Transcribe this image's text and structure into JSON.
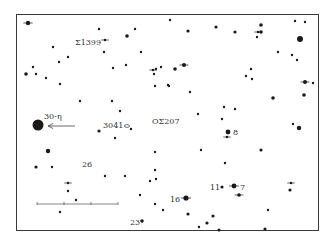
{
  "chart_data": {
    "type": "scatter",
    "title": "",
    "frame": {
      "x": 16,
      "y": 14,
      "w": 303,
      "h": 217
    },
    "ink_color": "#1a1a1a",
    "labels": [
      {
        "text": "Σ1399",
        "x": 75,
        "y": 43
      },
      {
        "text": "30-η",
        "x": 44,
        "y": 117
      },
      {
        "text": "3041",
        "x": 103,
        "y": 126
      },
      {
        "text": "ΟΣ207",
        "x": 152,
        "y": 122
      },
      {
        "text": "8",
        "x": 233,
        "y": 133
      },
      {
        "text": "26",
        "x": 82,
        "y": 165
      },
      {
        "text": "11",
        "x": 210,
        "y": 188
      },
      {
        "text": "7",
        "x": 240,
        "y": 188
      },
      {
        "text": "16",
        "x": 170,
        "y": 200
      },
      {
        "text": "23",
        "x": 130,
        "y": 223
      }
    ],
    "arrow": {
      "from_x": 75,
      "from_y": 126,
      "to_x": 48,
      "to_y": 126
    },
    "scale_bar": {
      "x1": 37,
      "x2": 118,
      "y": 204,
      "ticks": [
        37,
        64,
        91,
        118
      ]
    },
    "stars": [
      {
        "x": 28,
        "y": 23,
        "r": 2.2,
        "cross": true
      },
      {
        "x": 99,
        "y": 29,
        "r": 1.2
      },
      {
        "x": 105,
        "y": 40,
        "r": 1.2,
        "cross": true
      },
      {
        "x": 127,
        "y": 36,
        "r": 1.8
      },
      {
        "x": 135,
        "y": 29,
        "r": 1.2
      },
      {
        "x": 170,
        "y": 20,
        "r": 1.2
      },
      {
        "x": 188,
        "y": 31,
        "r": 1.6
      },
      {
        "x": 216,
        "y": 27,
        "r": 1.6
      },
      {
        "x": 235,
        "y": 32,
        "r": 1.6
      },
      {
        "x": 261,
        "y": 25,
        "r": 1.8
      },
      {
        "x": 258,
        "y": 32,
        "r": 1.2,
        "cross": true
      },
      {
        "x": 261,
        "y": 32,
        "r": 1.8
      },
      {
        "x": 257,
        "y": 37,
        "r": 1.2
      },
      {
        "x": 295,
        "y": 21,
        "r": 1.2
      },
      {
        "x": 305,
        "y": 22,
        "r": 1.2
      },
      {
        "x": 300,
        "y": 39,
        "r": 3.0
      },
      {
        "x": 53,
        "y": 47,
        "r": 1.2
      },
      {
        "x": 68,
        "y": 57,
        "r": 1.2
      },
      {
        "x": 59,
        "y": 62,
        "r": 1.2
      },
      {
        "x": 104,
        "y": 52,
        "r": 1.2
      },
      {
        "x": 141,
        "y": 52,
        "r": 1.2
      },
      {
        "x": 26,
        "y": 74,
        "r": 1.8
      },
      {
        "x": 33,
        "y": 67,
        "r": 1.2
      },
      {
        "x": 36,
        "y": 74,
        "r": 1.2
      },
      {
        "x": 46,
        "y": 78,
        "r": 1.2
      },
      {
        "x": 60,
        "y": 84,
        "r": 1.2
      },
      {
        "x": 113,
        "y": 68,
        "r": 1.2
      },
      {
        "x": 126,
        "y": 65,
        "r": 1.2
      },
      {
        "x": 153,
        "y": 70,
        "r": 1.2,
        "cross": true
      },
      {
        "x": 156,
        "y": 69,
        "r": 1.2
      },
      {
        "x": 154,
        "y": 74,
        "r": 1.2
      },
      {
        "x": 161,
        "y": 67,
        "r": 1.2
      },
      {
        "x": 175,
        "y": 69,
        "r": 1.8
      },
      {
        "x": 184,
        "y": 65,
        "r": 2.0,
        "cross": true
      },
      {
        "x": 155,
        "y": 86,
        "r": 1.2
      },
      {
        "x": 169,
        "y": 86,
        "r": 1.2
      },
      {
        "x": 190,
        "y": 92,
        "r": 1.2
      },
      {
        "x": 278,
        "y": 52,
        "r": 1.2
      },
      {
        "x": 292,
        "y": 55,
        "r": 1.2
      },
      {
        "x": 297,
        "y": 60,
        "r": 1.2
      },
      {
        "x": 251,
        "y": 69,
        "r": 1.2
      },
      {
        "x": 246,
        "y": 76,
        "r": 1.2
      },
      {
        "x": 252,
        "y": 79,
        "r": 1.2
      },
      {
        "x": 168,
        "y": 85,
        "r": 1.2
      },
      {
        "x": 305,
        "y": 82,
        "r": 2.0,
        "cross": true
      },
      {
        "x": 313,
        "y": 83,
        "r": 1.2
      },
      {
        "x": 304,
        "y": 95,
        "r": 1.8
      },
      {
        "x": 273,
        "y": 98,
        "r": 1.8
      },
      {
        "x": 80,
        "y": 101,
        "r": 1.2
      },
      {
        "x": 112,
        "y": 101,
        "r": 1.2
      },
      {
        "x": 120,
        "y": 111,
        "r": 1.2
      },
      {
        "x": 224,
        "y": 107,
        "r": 1.2
      },
      {
        "x": 235,
        "y": 109,
        "r": 1.2
      },
      {
        "x": 38,
        "y": 125,
        "r": 5.5
      },
      {
        "x": 99,
        "y": 131,
        "r": 1.6
      },
      {
        "x": 131,
        "y": 129,
        "r": 1.2
      },
      {
        "x": 115,
        "y": 138,
        "r": 1.2
      },
      {
        "x": 198,
        "y": 114,
        "r": 1.2
      },
      {
        "x": 222,
        "y": 119,
        "r": 1.2
      },
      {
        "x": 293,
        "y": 124,
        "r": 1.2
      },
      {
        "x": 299,
        "y": 128,
        "r": 2.2
      },
      {
        "x": 228,
        "y": 132,
        "r": 2.4
      },
      {
        "x": 227,
        "y": 137,
        "r": 1.2,
        "cross": true
      },
      {
        "x": 48,
        "y": 151,
        "r": 2.2
      },
      {
        "x": 201,
        "y": 150,
        "r": 1.2
      },
      {
        "x": 261,
        "y": 150,
        "r": 1.6
      },
      {
        "x": 36,
        "y": 167,
        "r": 1.6
      },
      {
        "x": 52,
        "y": 167,
        "r": 1.2
      },
      {
        "x": 105,
        "y": 176,
        "r": 1.2
      },
      {
        "x": 125,
        "y": 176,
        "r": 1.2
      },
      {
        "x": 155,
        "y": 152,
        "r": 1.2
      },
      {
        "x": 155,
        "y": 170,
        "r": 1.2
      },
      {
        "x": 150,
        "y": 181,
        "r": 1.2
      },
      {
        "x": 156,
        "y": 179,
        "r": 1.2
      },
      {
        "x": 225,
        "y": 163,
        "r": 1.2
      },
      {
        "x": 68,
        "y": 183,
        "r": 1.2,
        "cross": true
      },
      {
        "x": 68,
        "y": 191,
        "r": 1.2
      },
      {
        "x": 76,
        "y": 200,
        "r": 1.2
      },
      {
        "x": 60,
        "y": 212,
        "r": 1.2
      },
      {
        "x": 140,
        "y": 195,
        "r": 1.2
      },
      {
        "x": 155,
        "y": 204,
        "r": 1.2
      },
      {
        "x": 163,
        "y": 210,
        "r": 1.2
      },
      {
        "x": 222,
        "y": 187,
        "r": 1.6
      },
      {
        "x": 234,
        "y": 186,
        "r": 2.4,
        "cross": true
      },
      {
        "x": 239,
        "y": 195,
        "r": 1.8,
        "cross": true
      },
      {
        "x": 291,
        "y": 183,
        "r": 1.2,
        "cross": true
      },
      {
        "x": 290,
        "y": 190,
        "r": 1.6
      },
      {
        "x": 186,
        "y": 198,
        "r": 2.6,
        "cross": true
      },
      {
        "x": 188,
        "y": 214,
        "r": 1.6
      },
      {
        "x": 213,
        "y": 216,
        "r": 1.6
      },
      {
        "x": 207,
        "y": 223,
        "r": 1.6
      },
      {
        "x": 199,
        "y": 227,
        "r": 1.2
      },
      {
        "x": 219,
        "y": 230,
        "r": 1.6
      },
      {
        "x": 268,
        "y": 210,
        "r": 1.2
      },
      {
        "x": 265,
        "y": 229,
        "r": 1.6
      },
      {
        "x": 142,
        "y": 221,
        "r": 1.8
      }
    ]
  }
}
